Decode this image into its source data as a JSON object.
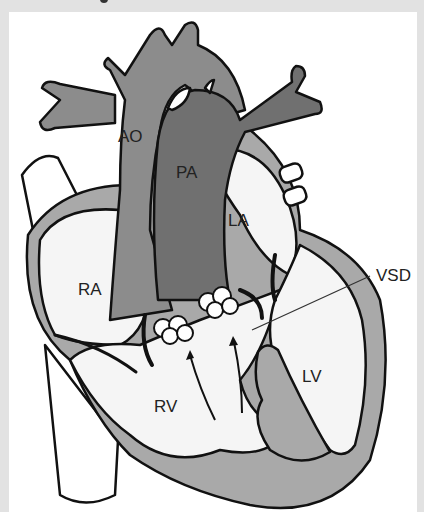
{
  "diagram": {
    "type": "anatomical heart illustration",
    "labels": {
      "ao": "AO",
      "pa": "PA",
      "la": "LA",
      "ra": "RA",
      "rv": "RV",
      "lv": "LV",
      "vsd": "VSD"
    },
    "colors": {
      "aorta": "#8c8c8c",
      "pulmonary_artery": "#707070",
      "myocardium": "#a9a9a9",
      "chamber": "#f5f5f5",
      "outline": "#111111",
      "background": "#ffffff",
      "frame": "#e2e2e2"
    }
  }
}
